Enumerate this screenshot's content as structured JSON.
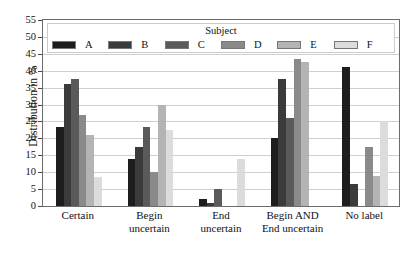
{
  "chart_data": {
    "type": "bar",
    "title": "",
    "xlabel": "",
    "ylabel": "Distribution in %",
    "ylim": [
      0,
      55
    ],
    "ytick_step": 5,
    "yticks": [
      "0",
      "5",
      "10",
      "15",
      "20",
      "25",
      "30",
      "35",
      "40",
      "45",
      "50",
      "55"
    ],
    "grid": true,
    "legend_title": "Subject",
    "legend_position": "top-inside",
    "categories": [
      "Certain",
      "Begin uncertain",
      "End uncertain",
      "Begin AND End uncertain",
      "No label"
    ],
    "category_lines": [
      [
        "Certain"
      ],
      [
        "Begin",
        "uncertain"
      ],
      [
        "End",
        "uncertain"
      ],
      [
        "Begin AND",
        "End uncertain"
      ],
      [
        "No label"
      ]
    ],
    "series": [
      {
        "name": "A",
        "color": "#1d1d1d",
        "values": [
          23.5,
          14.0,
          2.0,
          20.0,
          41.0
        ]
      },
      {
        "name": "B",
        "color": "#3b3b3b",
        "values": [
          36.0,
          17.5,
          1.0,
          37.5,
          6.5
        ]
      },
      {
        "name": "C",
        "color": "#5a5a5a",
        "values": [
          37.5,
          23.5,
          5.0,
          26.0,
          0.0
        ]
      },
      {
        "name": "D",
        "color": "#8a8a8a",
        "values": [
          27.0,
          10.0,
          0.0,
          43.5,
          17.5
        ]
      },
      {
        "name": "E",
        "color": "#b4b4b4",
        "values": [
          21.0,
          30.0,
          0.0,
          42.5,
          9.0
        ]
      },
      {
        "name": "F",
        "color": "#dcdcdc",
        "values": [
          8.5,
          22.5,
          14.0,
          0.0,
          25.0
        ]
      }
    ]
  }
}
